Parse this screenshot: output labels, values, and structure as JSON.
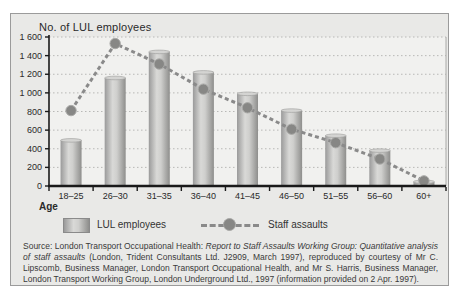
{
  "figure": {
    "y_axis_title": "No. of LUL employees",
    "x_axis_label": "Age"
  },
  "legend": {
    "bars_label": "LUL employees",
    "line_label": "Staff assaults"
  },
  "source": {
    "prefix": "Source: London Transport Occupational Health: ",
    "italic": "Report to Staff Assaults Working Group: Quantitative analysis of staff assaults",
    "suffix": " (London, Trident Consultants Ltd. J2909, March 1997), reproduced by courtesy of Mr C. Lipscomb, Business Manager, London Transport Occupational Health, and Mr S. Harris, Business Manager, London Transport Working Group, London Underground Ltd., 1997 (information provided on 2 Apr. 1997)."
  },
  "colors": {
    "panel_bg": "#e9e9e7",
    "plot_bg": "#f1f1ef",
    "panel_border": "#9b9b9b",
    "bar_dark": "#9a9a9a",
    "bar_light": "#d9d9d7",
    "line": "#8a8a8a",
    "marker": "#878785",
    "axis": "#1a1a1a",
    "grid": "#b8b8b6",
    "text": "#2a2a2a"
  },
  "chart_data": {
    "type": "bar",
    "subtype": "bar-line combo",
    "title": "No. of LUL employees",
    "xlabel": "Age",
    "ylabel": "No. of LUL employees",
    "categories": [
      "18–25",
      "26–30",
      "31–35",
      "36–40",
      "41–45",
      "46–50",
      "51–55",
      "56–60",
      "60+"
    ],
    "series": [
      {
        "name": "LUL employees",
        "type": "bar",
        "values": [
          490,
          1160,
          1440,
          1220,
          990,
          810,
          540,
          380,
          45
        ]
      },
      {
        "name": "Staff assaults",
        "type": "line",
        "values": [
          810,
          1530,
          1310,
          1040,
          840,
          610,
          465,
          290,
          55
        ]
      }
    ],
    "ylim": [
      0,
      1600
    ],
    "ytick_step": 200,
    "ytick_labels": [
      "0",
      "200",
      "400",
      "600",
      "800",
      "1 000",
      "1 200",
      "1 400",
      "1 600"
    ],
    "grid": "horizontal dotted",
    "legend_position": "bottom"
  }
}
